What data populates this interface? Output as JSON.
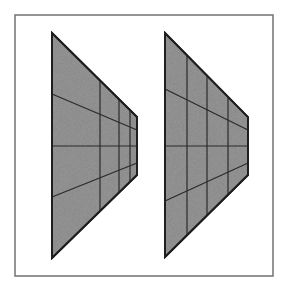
{
  "diagram": {
    "title": "Two perspective trapezoids with grid lines",
    "colors": {
      "background": "#ffffff",
      "frame": "#7a7a7a",
      "fill": "#9c9c9c",
      "stroke": "#1e1e1e"
    },
    "frame": {
      "x": 15,
      "y": 15,
      "width": 258,
      "height": 261
    },
    "figures": [
      {
        "id": "left",
        "label": "Left trapezoid (verticals compressed toward right edge)",
        "outline": [
          [
            52,
            33
          ],
          [
            137,
            117
          ],
          [
            137,
            175
          ],
          [
            52,
            258
          ]
        ],
        "vertical_lines": [
          {
            "x": 100,
            "y1": 80,
            "y2": 211
          },
          {
            "x": 119,
            "y1": 99,
            "y2": 193
          },
          {
            "x": 130,
            "y1": 110,
            "y2": 182
          }
        ],
        "converging_lines": [
          {
            "x1": 52,
            "y1": 94,
            "x2": 137,
            "y2": 130
          },
          {
            "x1": 52,
            "y1": 146,
            "x2": 137,
            "y2": 146
          },
          {
            "x1": 52,
            "y1": 197,
            "x2": 137,
            "y2": 163
          }
        ]
      },
      {
        "id": "right",
        "label": "Right trapezoid (verticals evenly spaced)",
        "outline": [
          [
            165,
            33
          ],
          [
            248,
            117
          ],
          [
            248,
            175
          ],
          [
            165,
            257
          ]
        ],
        "vertical_lines": [
          {
            "x": 187,
            "y1": 55,
            "y2": 235
          },
          {
            "x": 207,
            "y1": 75,
            "y2": 215
          },
          {
            "x": 228,
            "y1": 97,
            "y2": 195
          }
        ],
        "converging_lines": [
          {
            "x1": 165,
            "y1": 89,
            "x2": 248,
            "y2": 130
          },
          {
            "x1": 165,
            "y1": 146,
            "x2": 248,
            "y2": 146
          },
          {
            "x1": 165,
            "y1": 201,
            "x2": 248,
            "y2": 163
          }
        ]
      }
    ]
  }
}
